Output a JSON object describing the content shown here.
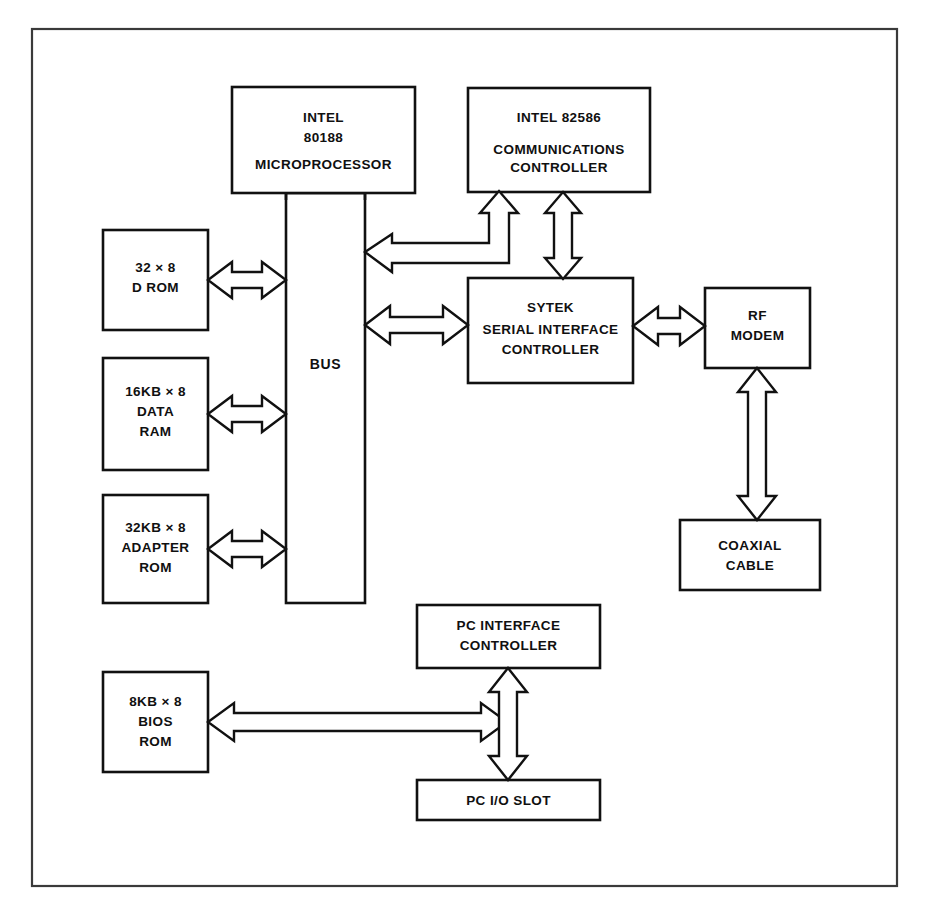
{
  "diagram": {
    "frame": {
      "name": "outer-border"
    },
    "colors": {
      "background": "#ffffff",
      "box_stroke": "#111111",
      "frame_stroke": "#3a3a3a",
      "text": "#101010",
      "arrow_fill": "#ffffff"
    },
    "blocks": [
      {
        "id": "microprocessor",
        "lines": [
          "INTEL",
          "80188",
          "MICROPROCESSOR"
        ],
        "line1": "INTEL",
        "line2": "80188",
        "line3": "MICROPROCESSOR"
      },
      {
        "id": "communications-controller",
        "lines": [
          "INTEL 82586",
          "COMMUNICATIONS",
          "CONTROLLER"
        ],
        "line1": "INTEL 82586",
        "line2": "COMMUNICATIONS",
        "line3": "CONTROLLER"
      },
      {
        "id": "d-rom",
        "lines": [
          "32 × 8",
          "D ROM"
        ],
        "line1": "32 × 8",
        "line2": "D ROM"
      },
      {
        "id": "data-ram",
        "lines": [
          "16KB × 8",
          "DATA",
          "RAM"
        ],
        "line1": "16KB × 8",
        "line2": "DATA",
        "line3": "RAM"
      },
      {
        "id": "adapter-rom",
        "lines": [
          "32KB × 8",
          "ADAPTER",
          "ROM"
        ],
        "line1": "32KB × 8",
        "line2": "ADAPTER",
        "line3": "ROM"
      },
      {
        "id": "bios-rom",
        "lines": [
          "8KB × 8",
          "BIOS",
          "ROM"
        ],
        "line1": "8KB × 8",
        "line2": "BIOS",
        "line3": "ROM"
      },
      {
        "id": "bus",
        "lines": [
          "BUS"
        ],
        "line1": "BUS"
      },
      {
        "id": "serial-interface-controller",
        "lines": [
          "SYTEK",
          "SERIAL INTERFACE",
          "CONTROLLER"
        ],
        "line1": "SYTEK",
        "line2": "SERIAL INTERFACE",
        "line3": "CONTROLLER"
      },
      {
        "id": "rf-modem",
        "lines": [
          "RF",
          "MODEM"
        ],
        "line1": "RF",
        "line2": "MODEM"
      },
      {
        "id": "coaxial-cable",
        "lines": [
          "COAXIAL",
          "CABLE"
        ],
        "line1": "COAXIAL",
        "line2": "CABLE"
      },
      {
        "id": "pc-interface-controller",
        "lines": [
          "PC INTERFACE",
          "CONTROLLER"
        ],
        "line1": "PC INTERFACE",
        "line2": "CONTROLLER"
      },
      {
        "id": "pc-io-slot",
        "lines": [
          "PC I/O SLOT"
        ],
        "line1": "PC I/O SLOT"
      }
    ],
    "connections": [
      {
        "id": "drom-bus",
        "from": "d-rom",
        "to": "bus",
        "style": "double-headed-horizontal"
      },
      {
        "id": "dataram-bus",
        "from": "data-ram",
        "to": "bus",
        "style": "double-headed-horizontal"
      },
      {
        "id": "adapterrom-bus",
        "from": "adapter-rom",
        "to": "bus",
        "style": "double-headed-horizontal"
      },
      {
        "id": "microprocessor-bus",
        "from": "microprocessor",
        "to": "bus",
        "style": "plain-line"
      },
      {
        "id": "commcontroller-bus",
        "from": "communications-controller",
        "to": "bus",
        "style": "bent-double-headed"
      },
      {
        "id": "commcontroller-sytek",
        "from": "communications-controller",
        "to": "serial-interface-controller",
        "style": "double-headed-vertical"
      },
      {
        "id": "bus-sytek",
        "from": "bus",
        "to": "serial-interface-controller",
        "style": "double-headed-horizontal"
      },
      {
        "id": "sytek-rfmodem",
        "from": "serial-interface-controller",
        "to": "rf-modem",
        "style": "double-headed-horizontal"
      },
      {
        "id": "rfmodem-coax",
        "from": "rf-modem",
        "to": "coaxial-cable",
        "style": "double-headed-vertical"
      },
      {
        "id": "biosrom-pcinterface",
        "from": "bios-rom",
        "to": "pc-interface-controller",
        "style": "double-headed-horizontal"
      },
      {
        "id": "pcinterface-pcioslot",
        "from": "pc-interface-controller",
        "to": "pc-io-slot",
        "style": "double-headed-vertical"
      }
    ]
  }
}
